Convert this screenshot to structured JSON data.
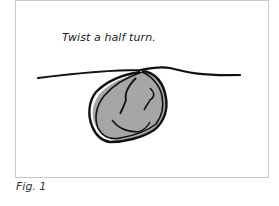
{
  "figure": {
    "instruction": "Twist a half turn.",
    "label": "Fig. 1",
    "colors": {
      "line": "#111111",
      "fill": "#a6a6a6",
      "border": "#c8c8c8"
    }
  }
}
